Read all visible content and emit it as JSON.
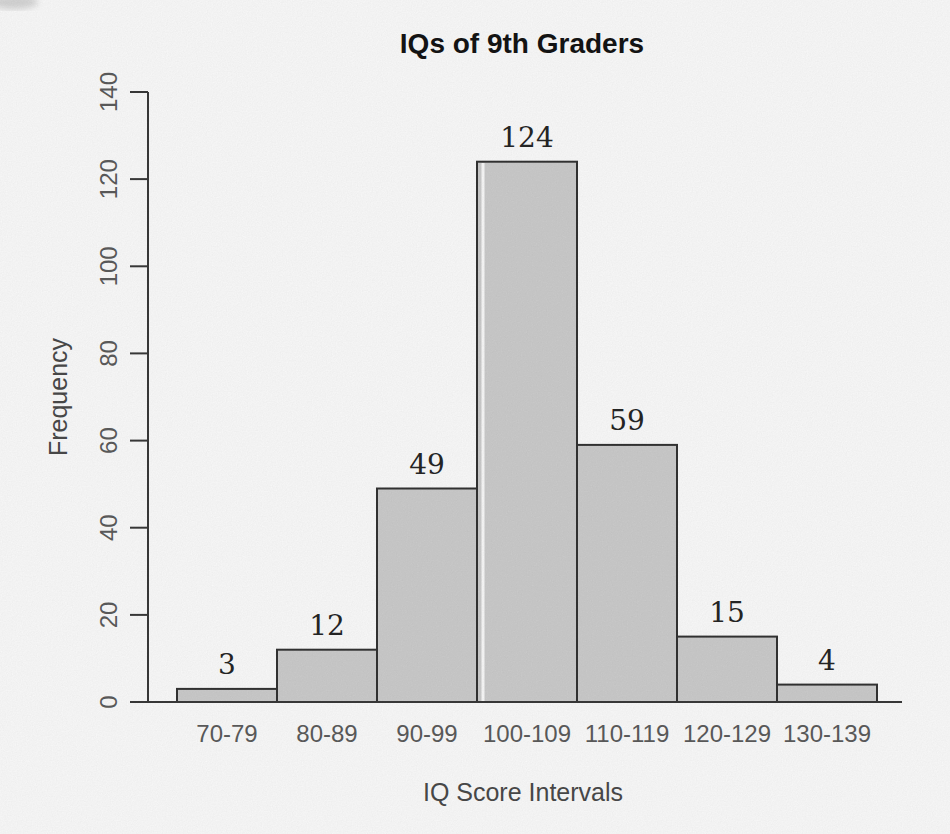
{
  "chart_data": {
    "type": "bar",
    "title": "IQs of 9th Graders",
    "xlabel": "IQ Score Intervals",
    "ylabel": "Frequency",
    "categories": [
      "70-79",
      "80-89",
      "90-99",
      "100-109",
      "110-119",
      "120-129",
      "130-139"
    ],
    "values": [
      3,
      12,
      49,
      124,
      59,
      15,
      4
    ],
    "y_ticks": [
      0,
      20,
      40,
      60,
      80,
      100,
      120,
      140
    ],
    "ylim": [
      0,
      140
    ],
    "grid": false,
    "legend": "none",
    "background_color": "#fcfcfc",
    "bar_fill": "#cdcdcd",
    "bar_border": "#333333",
    "axis_color": "#3a3a3a",
    "tick_label_color": "#5c5c5c",
    "axis_title_color": "#4a4a4a",
    "title_color": "#141414",
    "value_label_color": "#262626"
  }
}
